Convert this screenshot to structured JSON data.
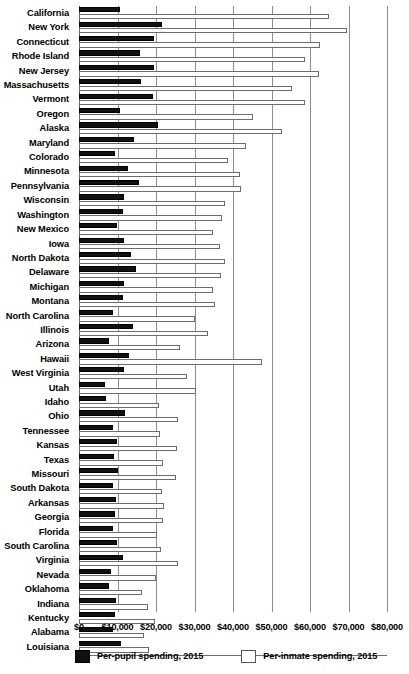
{
  "chart_data": {
    "type": "bar",
    "title": "",
    "subtitle": "",
    "xlabel": "",
    "ylabel": "",
    "orientation": "horizontal",
    "xlim": [
      0,
      80000
    ],
    "xticks": [
      0,
      10000,
      20000,
      30000,
      40000,
      50000,
      60000,
      70000,
      80000
    ],
    "xtick_labels": [
      "$0",
      "$10,000",
      "$20,000",
      "$30,000",
      "$40,000",
      "$50,000",
      "$60,000",
      "$70,000",
      "$80,000"
    ],
    "grid": true,
    "legend_position": "bottom",
    "categories": [
      "California",
      "New York",
      "Connecticut",
      "Rhode Island",
      "New Jersey",
      "Massachusetts",
      "Vermont",
      "Oregon",
      "Alaska",
      "Maryland",
      "Colorado",
      "Minnesota",
      "Pennsylvania",
      "Wisconsin",
      "Washington",
      "New Mexico",
      "Iowa",
      "North Dakota",
      "Delaware",
      "Michigan",
      "Montana",
      "North Carolina",
      "Illinois",
      "Arizona",
      "Hawaii",
      "West Virginia",
      "Utah",
      "Idaho",
      "Ohio",
      "Tennessee",
      "Kansas",
      "Texas",
      "Missouri",
      "South Dakota",
      "Arkansas",
      "Georgia",
      "Florida",
      "South Carolina",
      "Virginia",
      "Nevada",
      "Oklahoma",
      "Indiana",
      "Kentucky",
      "Alabama",
      "Louisiana"
    ],
    "series": [
      {
        "name": "Per-pupil spending, 2015",
        "color": "#111111",
        "values": [
          10700,
          21500,
          19400,
          15800,
          19400,
          16000,
          19100,
          10700,
          20500,
          14200,
          9400,
          12800,
          15600,
          11700,
          11500,
          9800,
          11600,
          13600,
          14700,
          11800,
          11500,
          8800,
          14100,
          7700,
          13100,
          11700,
          6800,
          7000,
          12000,
          8900,
          9900,
          9000,
          10000,
          8800,
          9700,
          9400,
          8900,
          9900,
          11300,
          8400,
          7800,
          9600,
          9300,
          8900,
          11000
        ]
      },
      {
        "name": "Per-inmate spending, 2015",
        "color": "#ffffff",
        "values": [
          65000,
          69600,
          62500,
          58800,
          62300,
          55300,
          58800,
          45300,
          52800,
          43300,
          38800,
          41700,
          42100,
          37900,
          37200,
          34800,
          36700,
          37800,
          36800,
          34800,
          35200,
          30000,
          33500,
          26300,
          47600,
          28000,
          30500,
          20700,
          25800,
          21100,
          25400,
          21900,
          25100,
          21600,
          22200,
          21700,
          20300,
          21400,
          25700,
          19900,
          16300,
          17800,
          19700,
          16900,
          18300
        ]
      }
    ]
  },
  "legend": {
    "items": [
      {
        "label": "Per-pupil spending, 2015",
        "swatch": "black"
      },
      {
        "label": "Per-inmate spending, 2015",
        "swatch": "white"
      }
    ]
  }
}
